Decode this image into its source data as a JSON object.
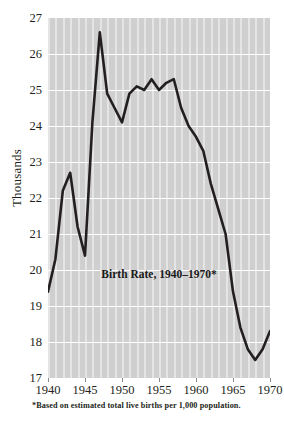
{
  "chart_data": {
    "type": "line",
    "title": "Birth Rate, 1940–1970*",
    "xlabel": "",
    "ylabel": "Thousands",
    "footnote": "*Based on estimated total live births per 1,000 population.",
    "xlim": [
      1940,
      1970
    ],
    "ylim": [
      17,
      27
    ],
    "grid": true,
    "legend": "none",
    "x_tick_labels": [
      "1940",
      "1945",
      "1950",
      "1955",
      "1960",
      "1965",
      "1970"
    ],
    "y_tick_labels": [
      "27",
      "26",
      "25",
      "24",
      "23",
      "22",
      "21",
      "20",
      "19",
      "18",
      "17"
    ],
    "x": [
      1940,
      1941,
      1942,
      1943,
      1944,
      1945,
      1946,
      1947,
      1948,
      1949,
      1950,
      1951,
      1952,
      1953,
      1954,
      1955,
      1956,
      1957,
      1958,
      1959,
      1960,
      1961,
      1962,
      1963,
      1964,
      1965,
      1966,
      1967,
      1968,
      1969,
      1970
    ],
    "values": [
      19.4,
      20.3,
      22.2,
      22.7,
      21.2,
      20.4,
      24.1,
      26.6,
      24.9,
      24.5,
      24.1,
      24.9,
      25.1,
      25.0,
      25.3,
      25.0,
      25.2,
      25.3,
      24.5,
      24.0,
      23.7,
      23.3,
      22.4,
      21.7,
      21.0,
      19.4,
      18.4,
      17.8,
      17.5,
      17.8,
      18.3
    ],
    "series_name": "Birth rate per 1,000 population",
    "line_color": "#231f20",
    "plot_bg_color": "#cfcfcf",
    "grid_color": "#ffffff"
  },
  "axis": {
    "y_title": "Thousands"
  }
}
